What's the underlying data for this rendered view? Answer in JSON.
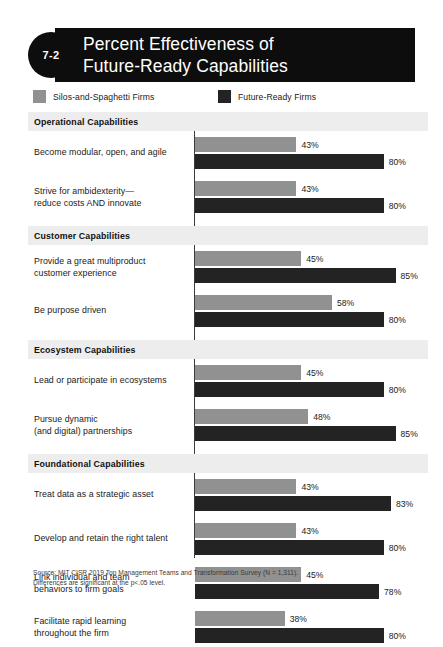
{
  "header": {
    "badge": "7-2",
    "title_line1": "Percent Effectiveness of",
    "title_line2": "Future-Ready Capabilities"
  },
  "legend": {
    "items": [
      {
        "label": "Silos-and-Spaghetti Firms",
        "color": "#919191",
        "key": "silos"
      },
      {
        "label": "Future-Ready Firms",
        "color": "#232323",
        "key": "future"
      }
    ]
  },
  "footnote": {
    "line1": "Source: MIT CISR 2019 Top Management Teams and Transformation Survey (N = 1,311).",
    "line2": "Differences are significant at the p<.05 level."
  },
  "chart_data": {
    "type": "bar",
    "orientation": "horizontal",
    "title": "Percent Effectiveness of Future-Ready Capabilities",
    "xlabel": "",
    "ylabel": "",
    "xlim": [
      0,
      90
    ],
    "grid": false,
    "legend_position": "top-left",
    "value_suffix": "%",
    "series": [
      {
        "name": "Silos-and-Spaghetti Firms",
        "color": "#919191"
      },
      {
        "name": "Future-Ready Firms",
        "color": "#232323"
      }
    ],
    "sections": [
      {
        "title": "Operational Capabilities",
        "rows": [
          {
            "label": "Become modular, open, and agile",
            "silos": 43,
            "future": 80
          },
          {
            "label": "Strive for ambidexterity—\nreduce costs AND innovate",
            "silos": 43,
            "future": 80
          }
        ]
      },
      {
        "title": "Customer Capabilities",
        "rows": [
          {
            "label": "Provide a great multiproduct\ncustomer experience",
            "silos": 45,
            "future": 85
          },
          {
            "label": "Be purpose driven",
            "silos": 58,
            "future": 80
          }
        ]
      },
      {
        "title": "Ecosystem Capabilities",
        "rows": [
          {
            "label": "Lead or participate in ecosystems",
            "silos": 45,
            "future": 80
          },
          {
            "label": "Pursue dynamic\n(and digital) partnerships",
            "silos": 48,
            "future": 85
          }
        ]
      },
      {
        "title": "Foundational Capabilities",
        "rows": [
          {
            "label": "Treat data as a strategic asset",
            "silos": 43,
            "future": 83
          },
          {
            "label": "Develop and retain the right talent",
            "silos": 43,
            "future": 80
          },
          {
            "label": "Link individual and team\nbehaviors to firm goals",
            "silos": 45,
            "future": 78
          },
          {
            "label": "Facilitate rapid learning\nthroughout the firm",
            "silos": 38,
            "future": 80
          }
        ]
      }
    ]
  }
}
